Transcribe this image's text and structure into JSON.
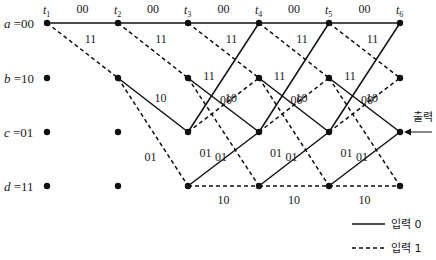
{
  "times": [
    "t1",
    "t2",
    "t3",
    "t4",
    "t5",
    "t6"
  ],
  "states": [
    {
      "id": "a",
      "label": "a =00"
    },
    {
      "id": "b",
      "label": "b =10"
    },
    {
      "id": "c",
      "label": "c =01"
    },
    {
      "id": "d",
      "label": "d =11"
    }
  ],
  "transitions": [
    {
      "from": "a",
      "to": "a",
      "input": 0,
      "output": "00"
    },
    {
      "from": "a",
      "to": "b",
      "input": 1,
      "output": "11"
    },
    {
      "from": "b",
      "to": "c",
      "input": 0,
      "output": "10"
    },
    {
      "from": "b",
      "to": "d",
      "input": 1,
      "output": "01"
    },
    {
      "from": "c",
      "to": "a",
      "input": 0,
      "output": "11"
    },
    {
      "from": "c",
      "to": "b",
      "input": 1,
      "output": "00"
    },
    {
      "from": "d",
      "to": "c",
      "input": 0,
      "output": "01"
    },
    {
      "from": "d",
      "to": "d",
      "input": 1,
      "output": "10"
    }
  ],
  "output_annotation": "출력",
  "legend": {
    "solid": "입력 0",
    "dashed": "입력 1"
  }
}
